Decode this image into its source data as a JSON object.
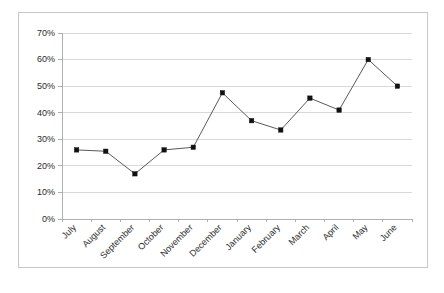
{
  "chart_data": {
    "type": "line",
    "title": "",
    "subtitle": "",
    "xlabel": "",
    "ylabel": "",
    "categories": [
      "July",
      "August",
      "September",
      "October",
      "November",
      "December",
      "January",
      "February",
      "March",
      "April",
      "May",
      "June"
    ],
    "values": [
      26,
      25.5,
      17,
      26,
      27,
      47.5,
      37,
      33.5,
      45.5,
      41,
      60,
      50
    ],
    "series": [
      {
        "name": "",
        "values": [
          26,
          25.5,
          17,
          26,
          27,
          47.5,
          37,
          33.5,
          45.5,
          41,
          60,
          50
        ]
      }
    ],
    "ylim": [
      0,
      70
    ],
    "ytick_values": [
      0,
      10,
      20,
      30,
      40,
      50,
      60,
      70
    ],
    "ytick_labels": [
      "0%",
      "10%",
      "20%",
      "30%",
      "40%",
      "50%",
      "60%",
      "70%"
    ],
    "grid": true,
    "grid_axis": "y",
    "legend": false,
    "legend_position": "none",
    "marker": "square",
    "line_color": "#595959",
    "marker_color": "#111111",
    "grid_color": "#d9d9d9",
    "axis_color": "#b0b0b0",
    "plot_background": "#ffffff",
    "frame_border_color": "#c8c8c8",
    "xtick_label_rotation": -45,
    "annotations": []
  }
}
